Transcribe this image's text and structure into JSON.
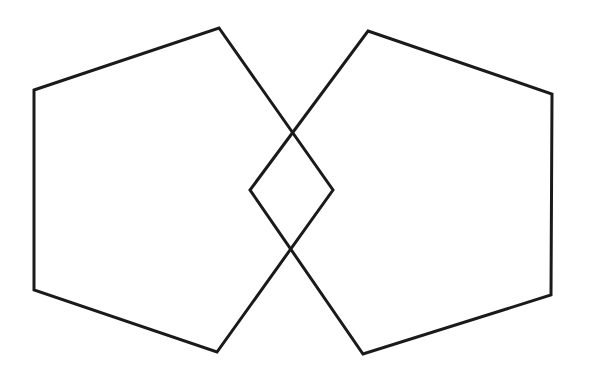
{
  "diagram": {
    "width": 595,
    "height": 376,
    "background": "#ffffff",
    "stroke_color": "#1a1a1a",
    "stroke_width": 3,
    "shapes": [
      {
        "name": "left-pentagon",
        "type": "pentagon",
        "points": [
          [
            34,
            90
          ],
          [
            219,
            28
          ],
          [
            333,
            190
          ],
          [
            217,
            352
          ],
          [
            34,
            290
          ]
        ]
      },
      {
        "name": "right-pentagon",
        "type": "pentagon",
        "points": [
          [
            368,
            31
          ],
          [
            552,
            94
          ],
          [
            551,
            295
          ],
          [
            363,
            354
          ],
          [
            250,
            190
          ]
        ]
      }
    ],
    "overlap_region": {
      "name": "diamond-intersection",
      "type": "rhombus",
      "points": [
        [
          291,
          133
        ],
        [
          333,
          190
        ],
        [
          291,
          250
        ],
        [
          250,
          190
        ]
      ]
    }
  }
}
